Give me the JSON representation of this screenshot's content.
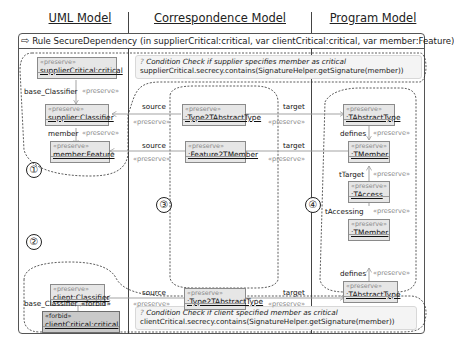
{
  "columns": {
    "uml": "UML Model",
    "correspondence": "Correspondence Model",
    "program": "Program Model"
  },
  "rule": {
    "arrow_icon": "right-arrow",
    "signature": "Rule SecureDependency (in supplierCritical:critical, var clientCritical:critical, var member:Feature)"
  },
  "conditions": {
    "supplier": {
      "icon": "question-mark",
      "title": "Condition Check if supplier specifies member as critical",
      "expression": "supplierCritical.secrecy.contains(SignatureHelper.getSignature(member))"
    },
    "client": {
      "icon": "question-mark",
      "title": "Condition Check if client specified member as critical",
      "expression": "clientCritical.secrecy.contains(SignatureHelper.getSignature(member))"
    }
  },
  "regions": [
    "①",
    "②",
    "③",
    "④"
  ],
  "nodes": {
    "supplierCritical": {
      "stereotype": "«preserve»",
      "name": "supplierCritical:critical"
    },
    "supplierClassifier": {
      "stereotype": "«preserve»",
      "name": "supplier:Classifier"
    },
    "memberFeature": {
      "stereotype": "«preserve»",
      "name": "member:Feature"
    },
    "clientClassifier": {
      "stereotype": "«preserve»",
      "name": "client:Classifier"
    },
    "clientCritical": {
      "stereotype": "«forbid»",
      "name": "clientCritical:critical"
    },
    "corrType1": {
      "stereotype": "«preserve»",
      "name": ":Type2TAbstractType"
    },
    "corrFeature": {
      "stereotype": "«preserve»",
      "name": ":Feature2TMember"
    },
    "corrType2": {
      "stereotype": "«preserve»",
      "name": ":Type2TAbstractType"
    },
    "tAbstractType1": {
      "stereotype": "«preserve»",
      "name": ":TAbstractType"
    },
    "tMember1": {
      "stereotype": "«preserve»",
      "name": ":TMember"
    },
    "tAccess": {
      "stereotype": "«preserve»",
      "name": ":TAccess"
    },
    "tMember2": {
      "stereotype": "«preserve»",
      "name": ":TMember"
    },
    "tAbstractType2": {
      "stereotype": "«preserve»",
      "name": ":TAbstractType"
    }
  },
  "edges": {
    "base_classifier_1": {
      "label": "base_Classifier",
      "stereotype": "«preserve»"
    },
    "member": {
      "label": "member",
      "stereotype": "«preserve»"
    },
    "source1": {
      "label": "source",
      "stereotype": "«preserve»"
    },
    "source2": {
      "label": "source",
      "stereotype": "«preserve»"
    },
    "source3": {
      "label": "source",
      "stereotype": "«preserve»"
    },
    "target1": {
      "label": "target",
      "stereotype": "«preserve»"
    },
    "target2": {
      "label": "target",
      "stereotype": "«preserve»"
    },
    "target3": {
      "label": "target",
      "stereotype": "«preserve»"
    },
    "defines1": {
      "label": "defines",
      "stereotype": "«preserve»"
    },
    "tTarget": {
      "label": "tTarget",
      "stereotype": "«preserve»"
    },
    "tAccessing": {
      "label": "tAccessing",
      "stereotype": "«preserve»"
    },
    "defines2": {
      "label": "defines",
      "stereotype": "«preserve»"
    },
    "base_classifier_2": {
      "label": "base_Classifier",
      "stereotype": "«forbid»"
    }
  }
}
